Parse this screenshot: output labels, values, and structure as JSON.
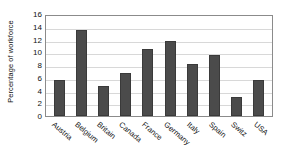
{
  "chart_data": {
    "type": "bar",
    "title": "",
    "xlabel": "",
    "ylabel": "Percentage of workforce",
    "categories": [
      "Austria",
      "Belgium",
      "Britain",
      "Canada",
      "France",
      "Germany",
      "Italy",
      "Spain",
      "Switz",
      "USA"
    ],
    "values": [
      5.7,
      13.5,
      4.7,
      6.8,
      10.5,
      11.8,
      8.2,
      9.5,
      3.0,
      5.7
    ],
    "ylim": [
      0,
      16
    ],
    "yticks": [
      0,
      2,
      4,
      6,
      8,
      10,
      12,
      14,
      16
    ],
    "ytick_labels": [
      "0",
      "2",
      "4",
      "6",
      "8",
      "10",
      "12",
      "14",
      "16"
    ],
    "grid": true,
    "legend": false,
    "bar_color": "#4b4b4b",
    "grid_color": "#d8d8d8",
    "axis_color": "#8b8b8b",
    "background_color": "#ffffff",
    "text_color": "#111111"
  }
}
